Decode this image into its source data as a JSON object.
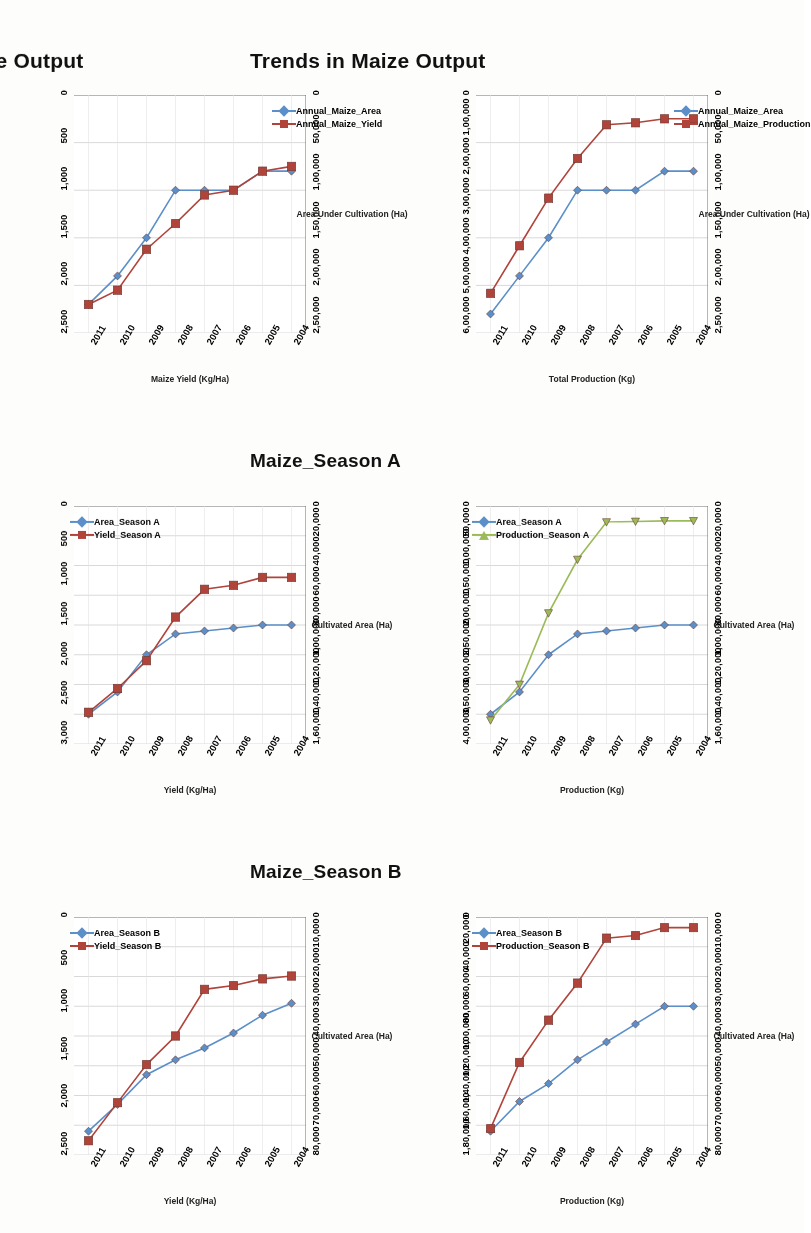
{
  "document": {
    "type": "scanned-figure-page",
    "orientation": "rotated-180",
    "colors": {
      "series_blue": "#5b8fc9",
      "series_red": "#b0433a",
      "series_green": "#9bbb59",
      "grid": "#c8c8c8",
      "axis": "#6f6f6f",
      "text": "#111111"
    }
  },
  "charts": [
    {
      "id": "annual-area-yield",
      "title": "Trends in Maize Output",
      "left_axis_title": "Area Under Cultivation (Ha)",
      "right_axis_title": "Maize Yield (Kg/Ha)",
      "left_ticks": [
        "0",
        "50,000",
        "1,00,000",
        "1,50,000",
        "2,00,000",
        "2,50,000"
      ],
      "right_ticks": [
        "0",
        "500",
        "1,000",
        "1,500",
        "2,000",
        "2,500"
      ],
      "legend": [
        {
          "label": "Annual_Maize_Area",
          "color": "#5b8fc9",
          "marker": "diamond"
        },
        {
          "label": "Annual_Maize_Yield",
          "color": "#b0433a",
          "marker": "square"
        }
      ]
    },
    {
      "id": "season-a-area-yield",
      "title": "Maize_Season A",
      "left_axis_title": "Cultivated Area (Ha)",
      "right_axis_title": "Yield (Kg/Ha)",
      "left_ticks": [
        "0",
        "20,000",
        "40,000",
        "60,000",
        "80,000",
        "1,00,000",
        "1,20,000",
        "1,40,000",
        "1,60,000"
      ],
      "right_ticks": [
        "0",
        "500",
        "1,000",
        "1,500",
        "2,000",
        "2,500",
        "3,000"
      ],
      "legend": [
        {
          "label": "Area_Season A",
          "color": "#5b8fc9",
          "marker": "diamond"
        },
        {
          "label": "Yield_Season A",
          "color": "#b0433a",
          "marker": "square"
        }
      ]
    },
    {
      "id": "season-b-area-yield",
      "title": "Maize_Season B",
      "left_axis_title": "Cultivated Area (Ha)",
      "right_axis_title": "Yield (Kg/Ha)",
      "left_ticks": [
        "0",
        "10,000",
        "20,000",
        "30,000",
        "40,000",
        "50,000",
        "60,000",
        "70,000",
        "80,000"
      ],
      "right_ticks": [
        "0",
        "500",
        "1,000",
        "1,500",
        "2,000",
        "2,500"
      ],
      "legend": [
        {
          "label": "Area_Season B",
          "color": "#5b8fc9",
          "marker": "diamond"
        },
        {
          "label": "Yield_Season B",
          "color": "#b0433a",
          "marker": "square"
        }
      ]
    },
    {
      "id": "annual-area-production",
      "title": "Trends in Maize Output",
      "left_axis_title": "Area Under Cultivation (Ha)",
      "right_axis_title": "Total Production (Kg)",
      "left_ticks": [
        "0",
        "50,000",
        "1,00,000",
        "1,50,000",
        "2,00,000",
        "2,50,000"
      ],
      "right_ticks": [
        "0",
        "1,00,000",
        "2,00,000",
        "3,00,000",
        "4,00,000",
        "5,00,000",
        "6,00,000"
      ],
      "legend": [
        {
          "label": "Annual_Maize_Area",
          "color": "#5b8fc9",
          "marker": "diamond"
        },
        {
          "label": "Annual_Maize_Production",
          "color": "#b0433a",
          "marker": "square"
        }
      ]
    },
    {
      "id": "season-a-area-production",
      "title": "Maize_Season A",
      "left_axis_title": "Cultivated Area (Ha)",
      "right_axis_title": "Production (Kg)",
      "left_ticks": [
        "0",
        "20,000",
        "40,000",
        "60,000",
        "80,000",
        "1,00,000",
        "1,20,000",
        "1,40,000",
        "1,60,000"
      ],
      "right_ticks": [
        "0",
        "50,000",
        "1,00,000",
        "1,50,000",
        "2,00,000",
        "2,50,000",
        "3,00,000",
        "3,50,000",
        "4,00,000"
      ],
      "legend": [
        {
          "label": "Area_Season A",
          "color": "#5b8fc9",
          "marker": "diamond"
        },
        {
          "label": "Production_Season A",
          "color": "#9bbb59",
          "marker": "triangle"
        }
      ]
    },
    {
      "id": "season-b-area-production",
      "title": "Maize_Season B",
      "left_axis_title": "Cultivated Area (Ha)",
      "right_axis_title": "Production (Kg)",
      "left_ticks": [
        "0",
        "10,000",
        "20,000",
        "30,000",
        "40,000",
        "50,000",
        "60,000",
        "70,000",
        "80,000"
      ],
      "right_ticks": [
        "0",
        "20,000",
        "40,000",
        "60,000",
        "80,000",
        "1,00,000",
        "1,20,000",
        "1,40,000",
        "1,60,000",
        "1,80,000"
      ],
      "legend": [
        {
          "label": "Area_Season B",
          "color": "#5b8fc9",
          "marker": "diamond"
        },
        {
          "label": "Production_Season B",
          "color": "#b0433a",
          "marker": "square"
        }
      ]
    }
  ],
  "chart_data": [
    {
      "id": "annual-area-yield",
      "type": "line",
      "title": "Trends in Maize Output",
      "xlabel": "",
      "x": [
        "2004",
        "2005",
        "2006",
        "2007",
        "2008",
        "2009",
        "2010",
        "2011"
      ],
      "ylabel": "Area Under Cultivation (Ha)",
      "ylim": [
        0,
        250000
      ],
      "y2label": "Maize Yield (Kg/Ha)",
      "y2lim": [
        0,
        2500
      ],
      "grid": true,
      "legend_position": "inside-left",
      "series": [
        {
          "name": "Annual_Maize_Area",
          "axis": "left",
          "color": "#5b8fc9",
          "marker": "diamond",
          "values": [
            80000,
            80000,
            100000,
            100000,
            100000,
            150000,
            190000,
            220000
          ]
        },
        {
          "name": "Annual_Maize_Yield",
          "axis": "right",
          "color": "#b0433a",
          "marker": "square",
          "values": [
            750,
            800,
            1000,
            1050,
            1350,
            1620,
            2050,
            2200
          ]
        }
      ]
    },
    {
      "id": "season-a-area-yield",
      "type": "line",
      "title": "Maize_Season A",
      "xlabel": "",
      "x": [
        "2004",
        "2005",
        "2006",
        "2007",
        "2008",
        "2009",
        "2010",
        "2011"
      ],
      "ylabel": "Cultivated Area (Ha)",
      "ylim": [
        0,
        160000
      ],
      "y2label": "Yield (Kg/Ha)",
      "y2lim": [
        0,
        3000
      ],
      "grid": true,
      "legend_position": "inside-left",
      "series": [
        {
          "name": "Area_Season A",
          "axis": "left",
          "color": "#5b8fc9",
          "marker": "diamond",
          "values": [
            80000,
            80000,
            82000,
            84000,
            86000,
            100000,
            125000,
            140000
          ]
        },
        {
          "name": "Yield_Season A",
          "axis": "right",
          "color": "#b0433a",
          "marker": "square",
          "values": [
            900,
            900,
            1000,
            1050,
            1400,
            1950,
            2300,
            2600
          ]
        }
      ]
    },
    {
      "id": "season-b-area-yield",
      "type": "line",
      "title": "Maize_Season B",
      "xlabel": "",
      "x": [
        "2004",
        "2005",
        "2006",
        "2007",
        "2008",
        "2009",
        "2010",
        "2011"
      ],
      "ylabel": "Cultivated Area (Ha)",
      "ylim": [
        0,
        80000
      ],
      "y2label": "Yield (Kg/Ha)",
      "y2lim": [
        0,
        2500
      ],
      "grid": true,
      "legend_position": "inside-left",
      "series": [
        {
          "name": "Area_Season B",
          "axis": "left",
          "color": "#5b8fc9",
          "marker": "diamond",
          "values": [
            29000,
            33000,
            39000,
            44000,
            48000,
            53000,
            63000,
            72000
          ]
        },
        {
          "name": "Yield_Season B",
          "axis": "right",
          "color": "#b0433a",
          "marker": "square",
          "values": [
            620,
            650,
            720,
            760,
            1250,
            1550,
            1950,
            2350
          ]
        }
      ]
    },
    {
      "id": "annual-area-production",
      "type": "line",
      "title": "Trends in Maize Output",
      "xlabel": "",
      "x": [
        "2004",
        "2005",
        "2006",
        "2007",
        "2008",
        "2009",
        "2010",
        "2011"
      ],
      "ylabel": "Area Under Cultivation (Ha)",
      "ylim": [
        0,
        250000
      ],
      "y2label": "Total Production (Kg)",
      "y2lim": [
        0,
        600000
      ],
      "grid": true,
      "legend_position": "inside-left",
      "series": [
        {
          "name": "Annual_Maize_Area",
          "axis": "left",
          "color": "#5b8fc9",
          "marker": "diamond",
          "values": [
            80000,
            80000,
            100000,
            100000,
            100000,
            150000,
            190000,
            230000
          ]
        },
        {
          "name": "Annual_Maize_Production",
          "axis": "right",
          "color": "#b0433a",
          "marker": "square",
          "values": [
            60000,
            60000,
            70000,
            75000,
            160000,
            260000,
            380000,
            500000
          ]
        }
      ]
    },
    {
      "id": "season-a-area-production",
      "type": "line",
      "title": "Maize_Season A",
      "xlabel": "",
      "x": [
        "2004",
        "2005",
        "2006",
        "2007",
        "2008",
        "2009",
        "2010",
        "2011"
      ],
      "ylabel": "Cultivated Area (Ha)",
      "ylim": [
        0,
        160000
      ],
      "y2label": "Production (Kg)",
      "y2lim": [
        0,
        400000
      ],
      "grid": true,
      "legend_position": "inside-left",
      "series": [
        {
          "name": "Area_Season A",
          "axis": "left",
          "color": "#5b8fc9",
          "marker": "diamond",
          "values": [
            80000,
            80000,
            82000,
            84000,
            86000,
            100000,
            125000,
            140000
          ]
        },
        {
          "name": "Production_Season A",
          "axis": "right",
          "color": "#9bbb59",
          "marker": "triangle",
          "values": [
            25000,
            25000,
            26000,
            27000,
            90000,
            180000,
            300000,
            360000
          ]
        }
      ]
    },
    {
      "id": "season-b-area-production",
      "type": "line",
      "title": "Maize_Season B",
      "xlabel": "",
      "x": [
        "2004",
        "2005",
        "2006",
        "2007",
        "2008",
        "2009",
        "2010",
        "2011"
      ],
      "ylabel": "Cultivated Area (Ha)",
      "ylim": [
        0,
        80000
      ],
      "y2label": "Production (Kg)",
      "y2lim": [
        0,
        180000
      ],
      "grid": true,
      "legend_position": "inside-left",
      "series": [
        {
          "name": "Area_Season B",
          "axis": "left",
          "color": "#5b8fc9",
          "marker": "diamond",
          "values": [
            30000,
            30000,
            36000,
            42000,
            48000,
            56000,
            62000,
            72000
          ]
        },
        {
          "name": "Production_Season B",
          "axis": "right",
          "color": "#b0433a",
          "marker": "square",
          "values": [
            8000,
            8000,
            14000,
            16000,
            50000,
            78000,
            110000,
            160000
          ]
        }
      ]
    }
  ]
}
